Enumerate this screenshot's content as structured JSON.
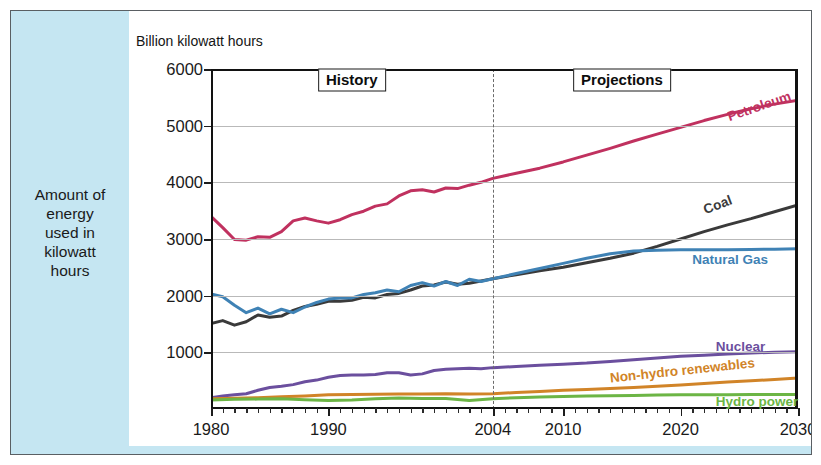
{
  "caption": {
    "text": "Amount of\nenergy\nused in\nkilowatt\nhours"
  },
  "chart_title": "Billion kilowatt hours",
  "era_labels": {
    "history": "History",
    "projections": "Projections"
  },
  "colors": {
    "petroleum": "#c0315f",
    "coal": "#3a3a3a",
    "natural_gas": "#3f82b5",
    "nuclear": "#6b4f9e",
    "non_hydro_renewables": "#d18428",
    "hydro_power": "#6cb545",
    "panel_background": "#ffffff",
    "figure_background": "#c5e6f2",
    "gridline": "#b9b9b9",
    "axis": "#121212",
    "divider": "#6b6b6b"
  },
  "chart_data": {
    "type": "line",
    "title": "Billion kilowatt hours",
    "xlabel": "",
    "ylabel": "Billion kilowatt hours",
    "xlim": [
      1980,
      2030
    ],
    "ylim": [
      0,
      6000
    ],
    "xticks": [
      1980,
      1990,
      2004,
      2010,
      2020,
      2030
    ],
    "xtick_labels": [
      "1980",
      "1990",
      "2004",
      "2010",
      "2020",
      "2030"
    ],
    "yticks": [
      1000,
      2000,
      3000,
      4000,
      5000,
      6000
    ],
    "ytick_labels": [
      "1000",
      "2000",
      "3000",
      "4000",
      "5000",
      "6000"
    ],
    "grid": "horizontal",
    "legend": "inline-labels",
    "history_projection_split": 2004,
    "annotations": [
      {
        "text": "History",
        "x": 1992,
        "y": 5800,
        "boxed": true
      },
      {
        "text": "Projections",
        "x": 2015,
        "y": 5800,
        "boxed": true
      }
    ],
    "series": [
      {
        "name": "Petroleum",
        "color": "#c0315f",
        "label_x": 2024,
        "label_y": 5150,
        "label_rotation": -19,
        "x": [
          1980,
          1981,
          1982,
          1983,
          1984,
          1985,
          1986,
          1987,
          1988,
          1989,
          1990,
          1991,
          1992,
          1993,
          1994,
          1995,
          1996,
          1997,
          1998,
          1999,
          2000,
          2001,
          2002,
          2003,
          2004,
          2006,
          2008,
          2010,
          2012,
          2014,
          2016,
          2018,
          2020,
          2022,
          2024,
          2026,
          2028,
          2030
        ],
        "values": [
          3400,
          3200,
          2990,
          2980,
          3040,
          3030,
          3130,
          3320,
          3370,
          3320,
          3280,
          3340,
          3430,
          3490,
          3580,
          3620,
          3760,
          3850,
          3870,
          3830,
          3900,
          3890,
          3950,
          4000,
          4070,
          4160,
          4250,
          4360,
          4480,
          4600,
          4730,
          4850,
          4970,
          5090,
          5200,
          5300,
          5380,
          5450
        ]
      },
      {
        "name": "Coal",
        "color": "#3a3a3a",
        "label_x": 2022,
        "label_y": 3520,
        "label_rotation": -21,
        "x": [
          1980,
          1981,
          1982,
          1983,
          1984,
          1985,
          1986,
          1987,
          1988,
          1989,
          1990,
          1991,
          1992,
          1993,
          1994,
          1995,
          1996,
          1997,
          1998,
          1999,
          2000,
          2001,
          2002,
          2003,
          2004,
          2006,
          2008,
          2010,
          2012,
          2014,
          2016,
          2018,
          2020,
          2022,
          2024,
          2026,
          2028,
          2030
        ],
        "values": [
          1510,
          1560,
          1480,
          1540,
          1660,
          1620,
          1640,
          1740,
          1810,
          1850,
          1900,
          1900,
          1920,
          1970,
          1960,
          2020,
          2040,
          2100,
          2170,
          2190,
          2240,
          2200,
          2220,
          2260,
          2300,
          2370,
          2440,
          2500,
          2580,
          2660,
          2750,
          2870,
          3000,
          3130,
          3250,
          3360,
          3480,
          3600
        ]
      },
      {
        "name": "Natural Gas",
        "color": "#3f82b5",
        "label_x": 2021,
        "label_y": 2640,
        "label_rotation": 0,
        "x": [
          1980,
          1981,
          1982,
          1983,
          1984,
          1985,
          1986,
          1987,
          1988,
          1989,
          1990,
          1991,
          1992,
          1993,
          1994,
          1995,
          1996,
          1997,
          1998,
          1999,
          2000,
          2001,
          2002,
          2003,
          2004,
          2006,
          2008,
          2010,
          2012,
          2014,
          2016,
          2018,
          2020,
          2022,
          2024,
          2026,
          2028,
          2030
        ],
        "values": [
          2030,
          1980,
          1830,
          1700,
          1780,
          1680,
          1760,
          1700,
          1800,
          1880,
          1940,
          1960,
          1960,
          2020,
          2050,
          2100,
          2070,
          2180,
          2230,
          2170,
          2250,
          2180,
          2290,
          2250,
          2300,
          2390,
          2480,
          2570,
          2660,
          2740,
          2790,
          2800,
          2810,
          2810,
          2810,
          2815,
          2820,
          2830
        ]
      },
      {
        "name": "Nuclear",
        "color": "#6b4f9e",
        "label_x": 2023,
        "label_y": 1120,
        "label_rotation": 0,
        "x": [
          1980,
          1981,
          1982,
          1983,
          1984,
          1985,
          1986,
          1987,
          1988,
          1989,
          1990,
          1991,
          1992,
          1993,
          1994,
          1995,
          1996,
          1997,
          1998,
          1999,
          2000,
          2001,
          2002,
          2003,
          2004,
          2006,
          2008,
          2010,
          2012,
          2014,
          2016,
          2018,
          2020,
          2022,
          2024,
          2026,
          2028,
          2030
        ],
        "values": [
          200,
          230,
          250,
          270,
          330,
          380,
          400,
          430,
          480,
          510,
          560,
          590,
          600,
          600,
          610,
          640,
          640,
          600,
          620,
          680,
          700,
          710,
          720,
          710,
          730,
          750,
          770,
          790,
          810,
          840,
          870,
          900,
          930,
          950,
          970,
          990,
          1000,
          1010
        ]
      },
      {
        "name": "Non-hydro renewables",
        "color": "#d18428",
        "label_x": 2014,
        "label_y": 540,
        "label_rotation": -6,
        "x": [
          1980,
          1982,
          1984,
          1986,
          1988,
          1990,
          1992,
          1994,
          1996,
          1998,
          2000,
          2002,
          2004,
          2006,
          2008,
          2010,
          2012,
          2014,
          2016,
          2018,
          2020,
          2022,
          2024,
          2026,
          2028,
          2030
        ],
        "values": [
          180,
          190,
          200,
          215,
          230,
          250,
          255,
          260,
          265,
          265,
          270,
          265,
          270,
          290,
          310,
          330,
          345,
          360,
          380,
          400,
          425,
          450,
          475,
          500,
          520,
          545
        ]
      },
      {
        "name": "Hydro power",
        "color": "#6cb545",
        "label_x": 2023,
        "label_y": 145,
        "label_rotation": 0,
        "x": [
          1980,
          1982,
          1984,
          1986,
          1988,
          1990,
          1992,
          1994,
          1996,
          1998,
          2000,
          2002,
          2004,
          2006,
          2008,
          2010,
          2012,
          2014,
          2016,
          2018,
          2020,
          2022,
          2024,
          2026,
          2028,
          2030
        ],
        "values": [
          160,
          170,
          175,
          180,
          165,
          150,
          160,
          180,
          195,
          185,
          185,
          150,
          180,
          200,
          210,
          220,
          230,
          235,
          240,
          245,
          250,
          250,
          252,
          255,
          255,
          258
        ]
      }
    ]
  }
}
